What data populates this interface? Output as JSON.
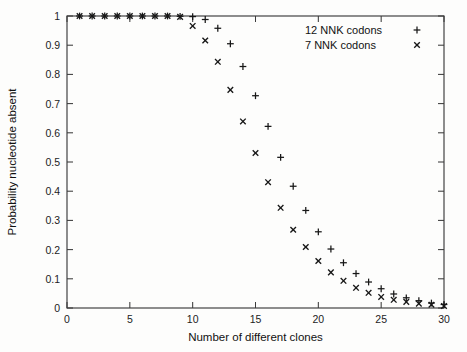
{
  "chart_data": {
    "type": "scatter",
    "title": "",
    "xlabel": "Number of different clones",
    "ylabel": "Probability nucleotide absent",
    "xlim": [
      0,
      30
    ],
    "ylim": [
      0,
      1
    ],
    "xticks": [
      0,
      5,
      10,
      15,
      20,
      25,
      30
    ],
    "xtick_labels": [
      "0",
      "5",
      "10",
      "15",
      "20",
      "25",
      "30"
    ],
    "xticks_minor": [
      1,
      2,
      3,
      4,
      6,
      7,
      8,
      9,
      11,
      12,
      13,
      14,
      16,
      17,
      18,
      19,
      21,
      22,
      23,
      24,
      26,
      27,
      28,
      29
    ],
    "yticks": [
      0,
      0.1,
      0.2,
      0.3,
      0.4,
      0.5,
      0.6,
      0.7,
      0.8,
      0.9,
      1
    ],
    "ytick_labels": [
      "0",
      "0.1",
      "0.2",
      "0.3",
      "0.4",
      "0.5",
      "0.6",
      "0.7",
      "0.8",
      "0.9",
      "1"
    ],
    "grid": false,
    "frame": true,
    "legend_position": "top-right",
    "marker_color": "#171717",
    "axis_color": "#3b3b3b",
    "background_color": "#fdfdfc",
    "series": [
      {
        "name": "12 NNK codons",
        "marker": "plus",
        "x": [
          1,
          2,
          3,
          4,
          5,
          6,
          7,
          8,
          9,
          10,
          11,
          12,
          13,
          14,
          15,
          16,
          17,
          18,
          19,
          20,
          21,
          22,
          23,
          24,
          25,
          26,
          27,
          28,
          29,
          30
        ],
        "values": [
          1.0,
          1.0,
          1.0,
          1.0,
          1.0,
          1.0,
          1.0,
          1.0,
          0.999,
          0.998,
          0.988,
          0.958,
          0.905,
          0.827,
          0.727,
          0.622,
          0.516,
          0.417,
          0.334,
          0.261,
          0.202,
          0.155,
          0.118,
          0.089,
          0.066,
          0.048,
          0.035,
          0.025,
          0.017,
          0.012
        ]
      },
      {
        "name": "7 NNK codons",
        "marker": "cross",
        "x": [
          1,
          2,
          3,
          4,
          5,
          6,
          7,
          8,
          9,
          10,
          11,
          12,
          13,
          14,
          15,
          16,
          17,
          18,
          19,
          20,
          21,
          22,
          23,
          24,
          25,
          26,
          27,
          28,
          29,
          30
        ],
        "values": [
          1.0,
          1.0,
          1.0,
          1.0,
          1.0,
          1.0,
          1.0,
          1.0,
          0.997,
          0.966,
          0.916,
          0.843,
          0.747,
          0.639,
          0.531,
          0.431,
          0.343,
          0.268,
          0.209,
          0.161,
          0.122,
          0.093,
          0.069,
          0.052,
          0.038,
          0.028,
          0.021,
          0.015,
          0.011,
          0.007
        ]
      }
    ]
  }
}
